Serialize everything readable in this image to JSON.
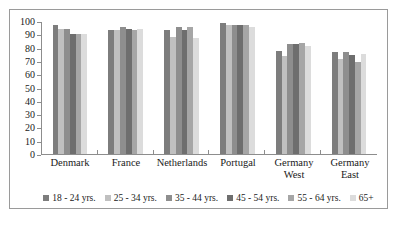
{
  "chart_data": {
    "type": "bar",
    "title": "",
    "subtitle": "",
    "xlabel": "",
    "ylabel": "",
    "ylim": [
      0,
      100
    ],
    "ytick_step": 10,
    "yticks": [
      "100",
      "90",
      "80",
      "70",
      "60",
      "50",
      "40",
      "30",
      "20",
      "10",
      "0"
    ],
    "grid": false,
    "legend_position": "bottom",
    "categories": [
      "Denmark",
      "France",
      "Netherlands",
      "Portugal",
      "Germany West",
      "Germany East"
    ],
    "category_lines": [
      [
        "Denmark"
      ],
      [
        "France"
      ],
      [
        "Netherlands"
      ],
      [
        "Portugal"
      ],
      [
        "Germany",
        "West"
      ],
      [
        "Germany",
        "East"
      ]
    ],
    "series": [
      {
        "name": "18 - 24 yrs.",
        "color": "#7d7d7d",
        "values": [
          98,
          94,
          94,
          99,
          78,
          77
        ]
      },
      {
        "name": "25 - 34 yrs.",
        "color": "#c0c0c0",
        "values": [
          95,
          94,
          89,
          98,
          74,
          72
        ]
      },
      {
        "name": "35 - 44 yrs.",
        "color": "#8e8e8e",
        "values": [
          95,
          96,
          96,
          98,
          83,
          77
        ]
      },
      {
        "name": "45 - 54 yrs.",
        "color": "#6e6e6e",
        "values": [
          91,
          95,
          94,
          98,
          83,
          75
        ]
      },
      {
        "name": "55 - 64 yrs.",
        "color": "#a6a6a6",
        "values": [
          91,
          94,
          96,
          98,
          84,
          70
        ]
      },
      {
        "name": "65+",
        "color": "#dcdcdc",
        "values": [
          91,
          95,
          88,
          96,
          82,
          76
        ]
      }
    ]
  },
  "figure": {
    "border_color": "#9a9a9a",
    "background": "#ffffff",
    "axis_color": "#8d8d8d"
  }
}
